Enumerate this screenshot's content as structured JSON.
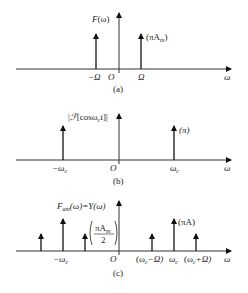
{
  "panels": [
    {
      "caption": "(a)",
      "ylabel": "F(ω)",
      "xlabel": "ω",
      "origin": "O",
      "impulses": [
        {
          "position": "-Ω",
          "label": "",
          "height": "short"
        },
        {
          "position": "Ω",
          "label": "(πAm)",
          "height": "short"
        }
      ],
      "tick_labels": [
        "-Ω",
        "O",
        "Ω"
      ]
    },
    {
      "caption": "(b)",
      "ylabel": "|F[cosωct]|",
      "xlabel": "ω",
      "origin": "O",
      "impulses": [
        {
          "position": "-ωc",
          "label": "",
          "height": "tall"
        },
        {
          "position": "ωc",
          "label": "(π)",
          "height": "tall"
        }
      ],
      "tick_labels": [
        "-ωc",
        "O",
        "ωc"
      ]
    },
    {
      "caption": "(c)",
      "ylabel": "Fam(ω)=Y(ω)",
      "xlabel": "ω",
      "origin": "O",
      "impulses": [
        {
          "position": "-ωc-Ω",
          "label": "",
          "height": "short"
        },
        {
          "position": "-ωc",
          "label": "",
          "height": "tall"
        },
        {
          "position": "-ωc+Ω",
          "label": "(πAm/2)",
          "height": "short"
        },
        {
          "position": "ωc-Ω",
          "label": "",
          "height": "short"
        },
        {
          "position": "ωc",
          "label": "(πA)",
          "height": "tall"
        },
        {
          "position": "ωc+Ω",
          "label": "",
          "height": "short"
        }
      ],
      "tick_labels": [
        "-ωc",
        "O",
        "(ωc-Ω)",
        "ωc",
        "(ωc+Ω)"
      ]
    }
  ],
  "text": {
    "a_ylabel_F": "F",
    "a_ylabel_arg": "(ω)",
    "a_amp": "(πA",
    "a_amp_sub": "m",
    "a_amp_close": ")",
    "a_neg_omega": "−Ω",
    "a_origin": "O",
    "a_pos_omega": "Ω",
    "a_x": "ω",
    "a_caption": "(a)",
    "b_ylabel_pre": "|",
    "b_ylabel_F": "ℱ",
    "b_ylabel_rest": "[cosω",
    "b_ylabel_sub": "c",
    "b_ylabel_end": "t]|",
    "b_amp": "(π)",
    "b_neg_wc": "−ω",
    "b_neg_wc_sub": "c",
    "b_origin": "O",
    "b_pos_wc": "ω",
    "b_pos_wc_sub": "c",
    "b_x": "ω",
    "b_caption": "(b)",
    "c_ylabel_F": "F",
    "c_ylabel_sub": "am",
    "c_ylabel_rest": "(ω)=Y(ω)",
    "c_amp_tall": "(πA)",
    "c_amp_short_num": "πA",
    "c_amp_short_num_sub": "m",
    "c_amp_short_den": "2",
    "c_neg_wc": "−ω",
    "c_neg_wc_sub": "c",
    "c_origin": "O",
    "c_wc_minus": "(ω",
    "c_wc_minus_sub": "c",
    "c_wc_minus_end": "−Ω)",
    "c_wc": "ω",
    "c_wc_sub": "c",
    "c_wc_plus": "(ω",
    "c_wc_plus_sub": "c",
    "c_wc_plus_end": "+Ω)",
    "c_x": "ω",
    "c_caption": "(c)"
  },
  "colors": {
    "ink": "#111111",
    "background": "#ffffff"
  }
}
